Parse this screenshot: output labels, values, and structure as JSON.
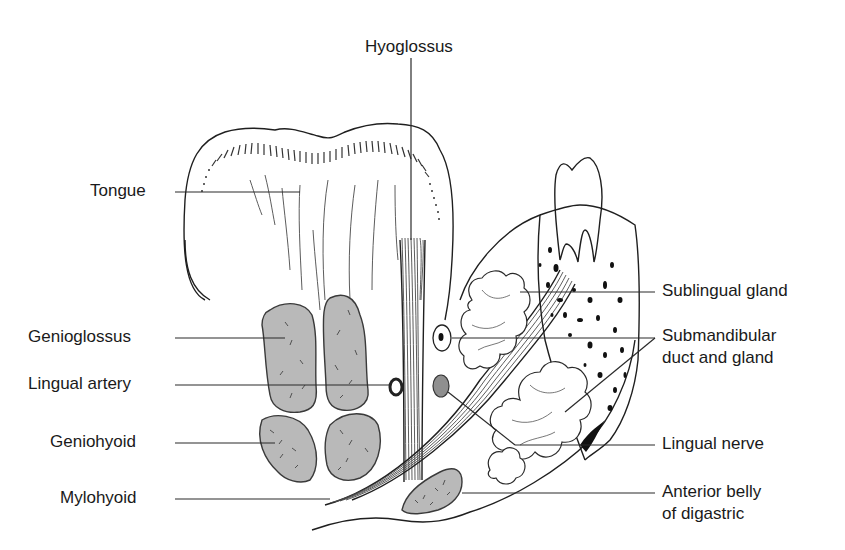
{
  "figure": {
    "colors": {
      "muscle_fill": "#b9b9b9",
      "outline": "#1f1f1f",
      "background": "#ffffff",
      "nerve_fill": "#8f8f8f"
    },
    "labels": {
      "hyoglossus": "Hyoglossus",
      "tongue": "Tongue",
      "genioglossus": "Genioglossus",
      "lingual_artery": "Lingual artery",
      "geniohyoid": "Geniohyoid",
      "mylohyoid": "Mylohyoid",
      "sublingual_gland": "Sublingual gland",
      "submandibular_line1": "Submandibular",
      "submandibular_line2": "duct and gland",
      "lingual_nerve": "Lingual nerve",
      "digastric_line1": "Anterior belly",
      "digastric_line2": "of digastric"
    }
  }
}
